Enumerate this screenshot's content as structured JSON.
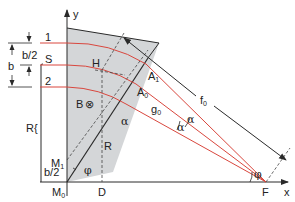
{
  "colors": {
    "beam": "#d9473e",
    "magnet_fill": "#d4d6d8",
    "line": "#2a2a2a",
    "background": "#ffffff"
  },
  "axes": {
    "x_label": "x",
    "y_label": "y"
  },
  "beams": {
    "ray1": "1",
    "central": "S",
    "ray2": "2"
  },
  "dimensions": {
    "b": "b",
    "b_half": "b/2",
    "b_half_bottom": "b/2",
    "R_left": "R",
    "R_inner": "R"
  },
  "points": {
    "H": "H",
    "A1": "A",
    "A1_sub": "1",
    "A0": "A",
    "A0_sub": "0",
    "M1": "M",
    "M1_sub": "1",
    "M0": "M",
    "M0_sub": "0",
    "D": "D",
    "F": "F"
  },
  "field": {
    "label": "B",
    "symbol": "⊗"
  },
  "distances": {
    "f0": "f",
    "f0_sub": "0",
    "g0": "g",
    "g0_sub": "0"
  },
  "angles": {
    "alpha_edge": "α",
    "alpha_upper": "α",
    "alpha_lower": "α",
    "phi_bottom": "φ",
    "phi_focus": "φ"
  }
}
